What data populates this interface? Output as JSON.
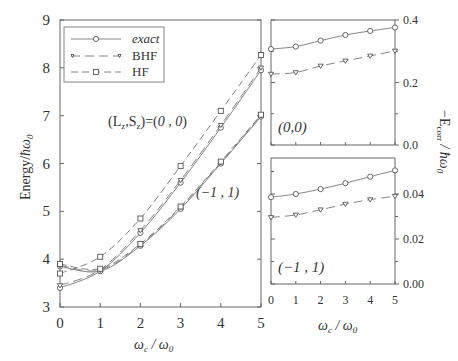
{
  "chart_data": [
    {
      "type": "line",
      "title": "",
      "xlabel": "ωc / ω0",
      "ylabel": "Energy/ħω0",
      "xlim": [
        0,
        5
      ],
      "ylim": [
        3,
        9
      ],
      "xticks": [
        "0",
        "1",
        "2",
        "3",
        "4",
        "5"
      ],
      "yticks": [
        "3",
        "4",
        "5",
        "6",
        "7",
        "8",
        "9"
      ],
      "grid": false,
      "legend": {
        "position": "upper left",
        "entries": [
          "exact",
          "BHF",
          "HF"
        ]
      },
      "annotations": [
        "(Lz,Sz)=(0,0)",
        "(−1,1)"
      ],
      "x": [
        0,
        1,
        2,
        3,
        4,
        5
      ],
      "series": [
        {
          "name": "exact",
          "state": "(0,0)",
          "values": [
            3.4,
            3.75,
            4.55,
            5.6,
            6.75,
            7.95
          ]
        },
        {
          "name": "BHF",
          "state": "(0,0)",
          "values": [
            3.45,
            3.78,
            4.6,
            5.65,
            6.8,
            8.0
          ]
        },
        {
          "name": "HF",
          "state": "(0,0)",
          "values": [
            3.7,
            4.05,
            4.85,
            5.95,
            7.1,
            8.27
          ]
        },
        {
          "name": "exact",
          "state": "(-1,1)",
          "values": [
            3.85,
            3.75,
            4.28,
            5.05,
            6.0,
            6.98
          ]
        },
        {
          "name": "BHF",
          "state": "(-1,1)",
          "values": [
            3.87,
            3.77,
            4.3,
            5.08,
            6.02,
            7.0
          ]
        },
        {
          "name": "HF",
          "state": "(-1,1)",
          "values": [
            3.9,
            3.8,
            4.32,
            5.1,
            6.04,
            7.02
          ]
        }
      ]
    },
    {
      "type": "line",
      "title": "(0,0)",
      "xlabel": "",
      "ylabel": "−Ecorr / ħω0",
      "xlim": [
        0,
        5
      ],
      "ylim": [
        0.0,
        0.4
      ],
      "xticks": [
        "0",
        "1",
        "2",
        "3",
        "4",
        "5"
      ],
      "yticks": [
        "0.0",
        "0.2",
        "0.4"
      ],
      "x": [
        0,
        1,
        2,
        3,
        4,
        5
      ],
      "series": [
        {
          "name": "exact",
          "values": [
            0.307,
            0.315,
            0.334,
            0.352,
            0.365,
            0.376
          ]
        },
        {
          "name": "BHF",
          "values": [
            0.227,
            0.232,
            0.253,
            0.269,
            0.285,
            0.301
          ]
        }
      ]
    },
    {
      "type": "line",
      "title": "(−1,1)",
      "xlabel": "ωc / ω0",
      "ylabel": "−Ecorr / ħω0",
      "xlim": [
        0,
        5
      ],
      "ylim": [
        0.0,
        0.056
      ],
      "xticks": [
        "0",
        "1",
        "2",
        "3",
        "4",
        "5"
      ],
      "yticks": [
        "0.00",
        "0.02",
        "0.04"
      ],
      "x": [
        0,
        1,
        2,
        3,
        4,
        5
      ],
      "series": [
        {
          "name": "exact",
          "values": [
            0.0386,
            0.04,
            0.0422,
            0.0448,
            0.0477,
            0.0505
          ]
        },
        {
          "name": "BHF",
          "values": [
            0.0296,
            0.0307,
            0.033,
            0.0355,
            0.0375,
            0.039
          ]
        }
      ]
    }
  ],
  "labels": {
    "main_ylabel_prefix": "Energy/",
    "main_ylabel_hbar": "ħω",
    "main_ylabel_sub": "0",
    "xlabel_omega_c": "ω",
    "xlabel_c": "c",
    "xlabel_slash": " / ",
    "xlabel_omega_0": "ω",
    "xlabel_0": "0",
    "annot_00_prefix": "(L",
    "annot_00_z1": "z",
    "annot_00_mid": ",S",
    "annot_00_z2": "z",
    "annot_00_suffix": ")=(",
    "annot_00_val": "0 , 0",
    "annot_00_close": ")",
    "annot_m11": "(−1 , 1)",
    "panel_top_label": "(0,0)",
    "panel_bottom_label": "(−1 , 1)",
    "right_ylabel_main": "−E",
    "right_ylabel_sub": "corr",
    "right_ylabel_rest": " / ħω",
    "right_ylabel_sub0": "0"
  }
}
